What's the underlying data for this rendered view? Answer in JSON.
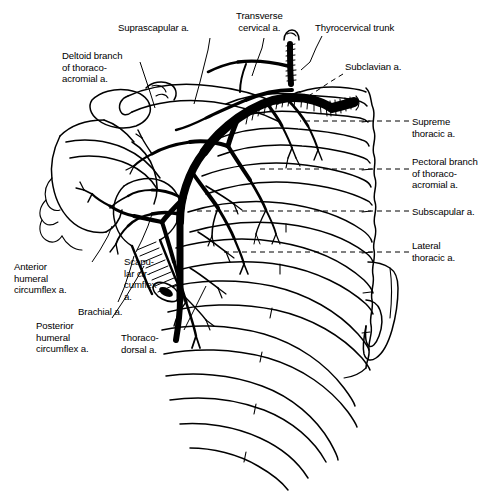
{
  "figure": {
    "type": "anatomical-line-illustration",
    "background_color": "#ffffff",
    "ink_color": "#000000",
    "width": 491,
    "height": 501
  },
  "labels": [
    {
      "id": "suprascapular",
      "text": "Suprascapular a.",
      "x": 118,
      "y": 22,
      "align": "left"
    },
    {
      "id": "transverse-cervical",
      "text": "Transverse\ncervical a.",
      "x": 236,
      "y": 10,
      "align": "left"
    },
    {
      "id": "thyrocervical-trunk",
      "text": "Thyrocervical trunk",
      "x": 315,
      "y": 22,
      "align": "left"
    },
    {
      "id": "deltoid-branch",
      "text": "Deltoid branch\nof thoraco-\nacromial a.",
      "x": 62,
      "y": 50,
      "align": "left"
    },
    {
      "id": "subclavian",
      "text": "Subclavian a.",
      "x": 345,
      "y": 61,
      "align": "left"
    },
    {
      "id": "supreme-thoracic",
      "text": "Supreme\nthoracic a.",
      "x": 412,
      "y": 116,
      "align": "left"
    },
    {
      "id": "pectoral-branch",
      "text": "Pectoral branch\nof thoraco-\nacromial a.",
      "x": 412,
      "y": 156,
      "align": "left"
    },
    {
      "id": "subscapular",
      "text": "Subscapular a.",
      "x": 412,
      "y": 206,
      "align": "left"
    },
    {
      "id": "lateral-thoracic",
      "text": "Lateral\nthoracic a.",
      "x": 412,
      "y": 240,
      "align": "left"
    },
    {
      "id": "anterior-humeral-circumflex",
      "text": "Anterior\nhumeral\ncircumflex a.",
      "x": 14,
      "y": 261,
      "align": "left"
    },
    {
      "id": "scapular-circumflex",
      "text": "Scapu-\nlar cir-\ncumflex\na.",
      "x": 124,
      "y": 256,
      "align": "left"
    },
    {
      "id": "brachial",
      "text": "Brachial a.",
      "x": 78,
      "y": 306,
      "align": "left"
    },
    {
      "id": "posterior-humeral-circumflex",
      "text": "Posterior\nhumeral\ncircumflex a.",
      "x": 36,
      "y": 320,
      "align": "left"
    },
    {
      "id": "thoracodorsal",
      "text": "Thoraco-\ndorsal a.",
      "x": 121,
      "y": 332,
      "align": "left"
    }
  ],
  "leader_lines": [
    {
      "id": "leader-suprascapular",
      "style": "dashed",
      "points": "210,38 208,50 200,82 194,104"
    },
    {
      "id": "leader-transverse-cervical",
      "style": "dashed",
      "points": "264,38 262,48 256,64 252,76"
    },
    {
      "id": "leader-thyrocervical",
      "style": "dashed",
      "points": "322,36 316,48 310,62 305,72"
    },
    {
      "id": "leader-deltoid",
      "style": "dashed",
      "points": "140,62 144,74 150,92 155,108"
    },
    {
      "id": "leader-subclavian",
      "style": "dashed",
      "points": "343,74 330,82 318,90 310,95"
    },
    {
      "id": "leader-supreme-thoracic",
      "style": "dashed",
      "points": "409,121 330,121 312,121"
    },
    {
      "id": "leader-pectoral",
      "style": "dashed",
      "points": "409,169 300,169 262,169"
    },
    {
      "id": "leader-subscapular",
      "style": "dashed",
      "points": "409,211 300,211 196,211"
    },
    {
      "id": "leader-lateral-thoracic",
      "style": "dashed",
      "points": "409,252 320,252 226,252"
    },
    {
      "id": "leader-anterior-humeral",
      "style": "dashed",
      "points": "92,262 100,250 108,236 112,226"
    },
    {
      "id": "leader-scapular-circumflex",
      "style": "dashed",
      "points": "136,252 142,240 148,226 152,214"
    },
    {
      "id": "leader-brachial",
      "style": "dashed",
      "points": "118,302 124,288 130,270 134,256"
    },
    {
      "id": "leader-posterior-humeral",
      "style": "dashed",
      "points": "112,318 124,300 136,280 144,266"
    },
    {
      "id": "leader-thoracodorsal",
      "style": "dashed",
      "points": "184,330 192,314 200,298 206,286"
    }
  ],
  "structures": [
    {
      "id": "clavicle",
      "name": "clavicle"
    },
    {
      "id": "scapula",
      "name": "scapula"
    },
    {
      "id": "humerus",
      "name": "humerus-cut-shaft"
    },
    {
      "id": "ribcage",
      "name": "ribcage",
      "rib_count": 8
    },
    {
      "id": "sternum",
      "name": "sternum"
    },
    {
      "id": "vertebral-column",
      "name": "vertebral-column"
    },
    {
      "id": "artery-tree",
      "name": "axillary-arterial-tree"
    }
  ]
}
